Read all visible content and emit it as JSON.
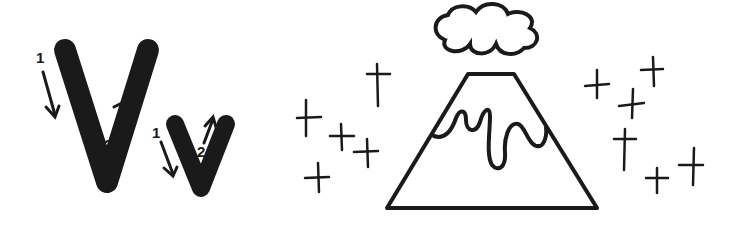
{
  "worksheet": {
    "letter_upper": "V",
    "letter_lower": "v",
    "stroke_numbers": {
      "upper_first": "1",
      "upper_second": "2",
      "lower_first": "1",
      "lower_second": "2"
    },
    "picture": "volcano",
    "picture_elements": [
      "smoke-cloud",
      "volcano",
      "lava",
      "sparkles"
    ]
  },
  "colors": {
    "ink": "#1a1a1a",
    "background": "#ffffff"
  }
}
